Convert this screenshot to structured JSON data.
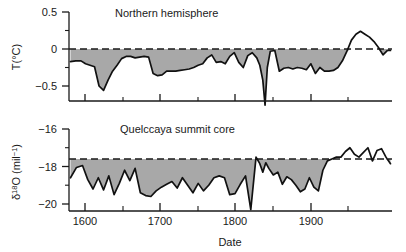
{
  "figure": {
    "xlabel": "Date",
    "xticklabels": [
      "1600",
      "1700",
      "1800",
      "1900"
    ],
    "xtickvalues": [
      1600,
      1700,
      1800,
      1900
    ],
    "xlim": [
      1558,
      1988
    ],
    "fill_color": "#a8a8a8",
    "line_color": "#111111",
    "axis_color": "#1a1a1a"
  },
  "panel_top": {
    "title": "Northern hemisphere",
    "ylabel_main": "T(",
    "ylabel_deg": "°",
    "ylabel_unit": "C)",
    "ylabel_full": "T(°C)",
    "yticklabels": [
      "0.5",
      "0",
      "−0.5"
    ],
    "ytickvalues": [
      0.5,
      0,
      -0.5
    ],
    "reference_value": 0
  },
  "panel_bottom": {
    "title": "Quelccaya summit core",
    "ylabel_sym": "δ",
    "ylabel_sup1": "18",
    "ylabel_mid": "O (mil",
    "ylabel_sup2": "−1",
    "ylabel_end": ")",
    "ylabel_full": "δ18O (mil−1)",
    "yticklabels": [
      "−16",
      "−18",
      "−20"
    ],
    "ytickvalues": [
      -16,
      -18,
      -20
    ],
    "reference_value": -17.6
  },
  "chart_data": {
    "type": "line",
    "title": "",
    "xlabel": "Date",
    "grid": false,
    "legend": "none",
    "panels": [
      {
        "name": "Northern hemisphere",
        "ylabel": "T(°C)",
        "ylim": [
          -0.8,
          0.5
        ],
        "yticks": [
          0.5,
          0,
          -0.5
        ],
        "xlim": [
          1558,
          1988
        ],
        "reference_line": 0,
        "reference_style": "dashed",
        "fill_below_reference": true,
        "series": [
          {
            "name": "Northern hemisphere temperature anomaly",
            "x": [
              1560,
              1567,
              1574,
              1580,
              1586,
              1592,
              1598,
              1604,
              1610,
              1616,
              1622,
              1628,
              1634,
              1640,
              1646,
              1652,
              1658,
              1664,
              1670,
              1676,
              1682,
              1688,
              1694,
              1700,
              1706,
              1712,
              1718,
              1724,
              1730,
              1736,
              1742,
              1748,
              1754,
              1760,
              1766,
              1772,
              1778,
              1784,
              1790,
              1796,
              1802,
              1808,
              1812,
              1816,
              1819,
              1822,
              1826,
              1832,
              1838,
              1844,
              1850,
              1856,
              1862,
              1868,
              1874,
              1880,
              1886,
              1892,
              1898,
              1904,
              1910,
              1916,
              1922,
              1928,
              1934,
              1940,
              1946,
              1952,
              1958,
              1964,
              1970,
              1976,
              1982,
              1986
            ],
            "y": [
              -0.17,
              -0.16,
              -0.16,
              -0.2,
              -0.22,
              -0.24,
              -0.5,
              -0.56,
              -0.42,
              -0.3,
              -0.22,
              -0.13,
              -0.1,
              -0.1,
              -0.12,
              -0.11,
              -0.1,
              -0.11,
              -0.33,
              -0.36,
              -0.35,
              -0.3,
              -0.3,
              -0.3,
              -0.29,
              -0.28,
              -0.27,
              -0.25,
              -0.22,
              -0.2,
              -0.12,
              -0.08,
              -0.18,
              -0.17,
              -0.2,
              -0.1,
              -0.05,
              -0.18,
              -0.25,
              -0.09,
              -0.05,
              -0.12,
              -0.22,
              -0.42,
              -0.76,
              -0.25,
              -0.03,
              -0.02,
              -0.3,
              -0.26,
              -0.25,
              -0.27,
              -0.25,
              -0.26,
              -0.28,
              -0.2,
              -0.33,
              -0.25,
              -0.3,
              -0.3,
              -0.29,
              -0.25,
              -0.16,
              -0.03,
              0.12,
              0.2,
              0.24,
              0.2,
              0.16,
              0.1,
              0.02,
              -0.08,
              -0.02,
              -0.02
            ]
          }
        ]
      },
      {
        "name": "Quelccaya summit core",
        "ylabel": "δ18O (mil−1)",
        "ylim": [
          -20.4,
          -16
        ],
        "yticks": [
          -16,
          -18,
          -20
        ],
        "xlim": [
          1558,
          1988
        ],
        "reference_line": -17.6,
        "reference_style": "dashed",
        "fill_below_reference": true,
        "series": [
          {
            "name": "Quelccaya ice core oxygen-18 isotope ratio",
            "x": [
              1560,
              1568,
              1576,
              1583,
              1590,
              1597,
              1604,
              1611,
              1618,
              1625,
              1632,
              1639,
              1646,
              1653,
              1660,
              1667,
              1674,
              1681,
              1688,
              1695,
              1702,
              1709,
              1716,
              1723,
              1730,
              1737,
              1744,
              1751,
              1758,
              1765,
              1772,
              1779,
              1786,
              1793,
              1800,
              1807,
              1812,
              1816,
              1820,
              1824,
              1830,
              1836,
              1842,
              1848,
              1854,
              1860,
              1866,
              1872,
              1878,
              1884,
              1890,
              1896,
              1902,
              1908,
              1914,
              1920,
              1926,
              1932,
              1938,
              1944,
              1950,
              1956,
              1962,
              1968,
              1974,
              1980,
              1986
            ],
            "y": [
              -18.6,
              -18.05,
              -17.95,
              -18.7,
              -19.2,
              -18.6,
              -19.25,
              -18.5,
              -19.5,
              -18.9,
              -18.2,
              -18.75,
              -18.1,
              -19.4,
              -19.55,
              -19.6,
              -19.3,
              -19.1,
              -18.95,
              -18.8,
              -19.15,
              -18.6,
              -19.0,
              -19.4,
              -18.9,
              -19.3,
              -19.0,
              -18.6,
              -18.5,
              -18.6,
              -19.5,
              -19.45,
              -18.95,
              -18.5,
              -20.3,
              -17.5,
              -17.85,
              -18.3,
              -17.8,
              -18.1,
              -18.45,
              -18.3,
              -18.95,
              -18.55,
              -18.7,
              -19.0,
              -19.35,
              -19.2,
              -18.6,
              -19.1,
              -19.3,
              -18.2,
              -17.7,
              -17.6,
              -17.5,
              -17.5,
              -17.2,
              -17.0,
              -17.35,
              -17.5,
              -17.25,
              -17.0,
              -17.7,
              -17.15,
              -17.05,
              -17.5,
              -17.85
            ]
          }
        ]
      }
    ]
  }
}
